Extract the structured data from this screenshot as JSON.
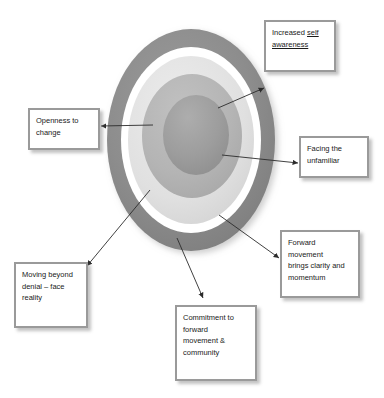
{
  "diagram": {
    "rings": [
      {
        "name": "outer-ring",
        "color": "#8d8d8d",
        "label": ""
      },
      {
        "name": "white-gap-ring",
        "color": "#ffffff",
        "label": ""
      },
      {
        "name": "light-gray-ring",
        "color": "#e2e2e2",
        "label": ""
      },
      {
        "name": "mid-gray-ring",
        "color": "#b4b4b4",
        "label": ""
      },
      {
        "name": "inner-core",
        "color": "#9d9d9d",
        "label": ""
      }
    ],
    "arrow_color": "#2b2b2b",
    "box_border_color": "#9a9a9a",
    "box_fill_color": "#ffffff"
  },
  "callouts": [
    {
      "name": "increased-self-awareness",
      "lines": [
        "Increased ",
        "self",
        "awareness"
      ],
      "line1a": "Increased ",
      "line1b": "self",
      "line2": "awareness"
    },
    {
      "name": "openness-to-change",
      "line1": "Openness to",
      "line2": "change"
    },
    {
      "name": "facing-the-unfamiliar",
      "line1": "Facing the",
      "line2": "unfamiliar"
    },
    {
      "name": "forward-movement-brings-clarity",
      "line1": "Forward",
      "line2": "movement",
      "line3": "brings clarity and",
      "line4": "momentum"
    },
    {
      "name": "moving-beyond-denial",
      "line1": "Moving beyond",
      "line2": "denial – face",
      "line3": "reality"
    },
    {
      "name": "commitment-to-forward-movement",
      "line1": "Commitment to",
      "line2": "forward",
      "line3": "movement &",
      "line4": "community"
    }
  ]
}
